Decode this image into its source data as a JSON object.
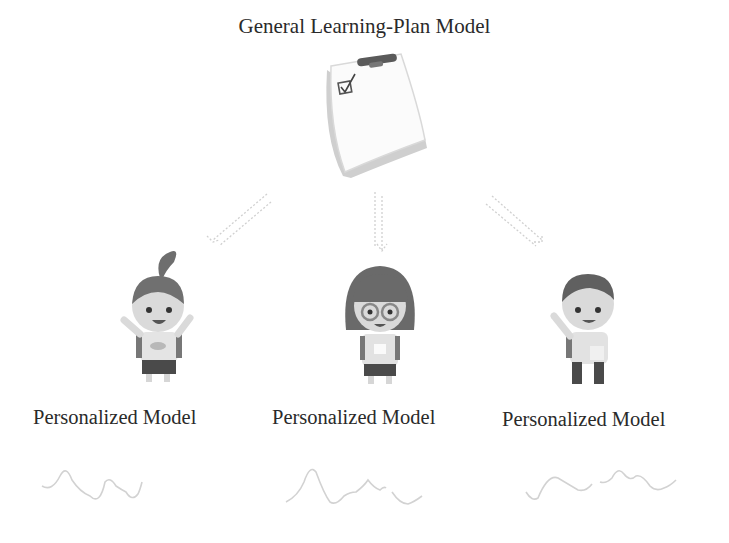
{
  "diagram": {
    "title": "General Learning-Plan Model",
    "root": {
      "icon": "clipboard-checklist-icon",
      "label": "General Learning-Plan Model"
    },
    "connectors": [
      {
        "from": "root",
        "to": "child-1",
        "style": "dotted-double-arrow"
      },
      {
        "from": "root",
        "to": "child-2",
        "style": "dotted-double-arrow"
      },
      {
        "from": "root",
        "to": "child-3",
        "style": "dotted-double-arrow"
      }
    ],
    "children": [
      {
        "id": "child-1",
        "icon": "student-ponytail-icon",
        "label": "Personalized Model",
        "curve": "wavy-line-1"
      },
      {
        "id": "child-2",
        "icon": "student-glasses-icon",
        "label": "Personalized Model",
        "curve": "wavy-line-2"
      },
      {
        "id": "child-3",
        "icon": "student-boy-waving-icon",
        "label": "Personalized Model",
        "curve": "wavy-line-3"
      }
    ],
    "colors": {
      "text": "#2a2a2a",
      "hair": "#6e6e6e",
      "skin": "#d9d9d9",
      "shirt": "#e4e4e4",
      "shorts": "#4a4a4a",
      "arrow": "#d0d0d0",
      "curve": "#d2d2d2"
    }
  }
}
